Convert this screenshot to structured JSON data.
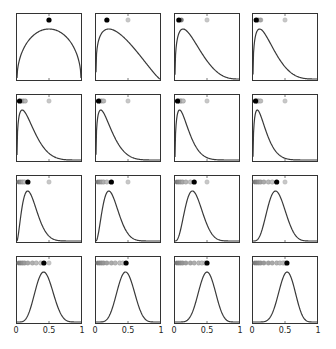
{
  "chart_data": {
    "type": "line",
    "title": "",
    "xlabel": "",
    "ylabel": "",
    "xlim": [
      0,
      1
    ],
    "x_ticks": [
      0,
      0.5,
      1
    ],
    "x_tick_labels": [
      "0",
      "0.5",
      "1"
    ],
    "grid": false,
    "legend": null,
    "colors": {
      "curve": "#3a3a3a",
      "frame": "#333333",
      "latest_dot": "#000000",
      "reference_dot": "#c8c8c8",
      "past_dot": "#9a9a9a"
    },
    "panels": [
      {
        "index": 1,
        "a": 1.5,
        "b": 1.5,
        "peak_x": 0.5,
        "latest": 0.5,
        "past": [],
        "reference": null
      },
      {
        "index": 2,
        "a": 1.3,
        "b": 2.2,
        "peak_x": 0.2,
        "latest": 0.17,
        "past": [],
        "reference": 0.5
      },
      {
        "index": 3,
        "a": 1.4,
        "b": 3.8,
        "peak_x": 0.12,
        "latest": 0.06,
        "past": [
          0.1
        ],
        "reference": 0.5
      },
      {
        "index": 4,
        "a": 1.4,
        "b": 4.5,
        "peak_x": 0.1,
        "latest": 0.05,
        "past": [
          0.08,
          0.12
        ],
        "reference": 0.5
      },
      {
        "index": 5,
        "a": 1.4,
        "b": 5.5,
        "peak_x": 0.08,
        "latest": 0.04,
        "past": [
          0.07,
          0.1,
          0.13
        ],
        "reference": 0.5
      },
      {
        "index": 6,
        "a": 1.4,
        "b": 6.0,
        "peak_x": 0.07,
        "latest": 0.04,
        "past": [
          0.06,
          0.09,
          0.12
        ],
        "reference": 0.5
      },
      {
        "index": 7,
        "a": 1.5,
        "b": 7.5,
        "peak_x": 0.07,
        "latest": 0.04,
        "past": [
          0.06,
          0.08,
          0.1,
          0.13
        ],
        "reference": 0.5
      },
      {
        "index": 8,
        "a": 1.5,
        "b": 8.0,
        "peak_x": 0.06,
        "latest": 0.04,
        "past": [
          0.05,
          0.07,
          0.09,
          0.12
        ],
        "reference": 0.5
      },
      {
        "index": 9,
        "a": 2.6,
        "b": 9.0,
        "peak_x": 0.17,
        "latest": 0.17,
        "past": [
          0.03,
          0.06,
          0.09,
          0.12
        ],
        "reference": 0.5
      },
      {
        "index": 10,
        "a": 3.0,
        "b": 9.0,
        "peak_x": 0.2,
        "latest": 0.24,
        "past": [
          0.03,
          0.06,
          0.09,
          0.12,
          0.17
        ],
        "reference": 0.5
      },
      {
        "index": 11,
        "a": 3.8,
        "b": 8.5,
        "peak_x": 0.28,
        "latest": 0.3,
        "past": [
          0.03,
          0.06,
          0.09,
          0.12,
          0.17,
          0.24
        ],
        "reference": 0.5
      },
      {
        "index": 12,
        "a": 4.8,
        "b": 8.0,
        "peak_x": 0.35,
        "latest": 0.37,
        "past": [
          0.03,
          0.06,
          0.09,
          0.12,
          0.17,
          0.24,
          0.3
        ],
        "reference": 0.5
      },
      {
        "index": 13,
        "a": 6.0,
        "b": 8.0,
        "peak_x": 0.42,
        "latest": 0.42,
        "past": [
          0.03,
          0.06,
          0.09,
          0.12,
          0.17,
          0.24,
          0.3,
          0.37
        ],
        "reference": 0.5
      },
      {
        "index": 14,
        "a": 7.0,
        "b": 8.0,
        "peak_x": 0.46,
        "latest": 0.47,
        "past": [
          0.03,
          0.06,
          0.09,
          0.12,
          0.17,
          0.24,
          0.3,
          0.37,
          0.42
        ],
        "reference": null
      },
      {
        "index": 15,
        "a": 8.0,
        "b": 8.0,
        "peak_x": 0.5,
        "latest": 0.5,
        "past": [
          0.03,
          0.06,
          0.09,
          0.12,
          0.17,
          0.24,
          0.3,
          0.37,
          0.42,
          0.47
        ],
        "reference": null
      },
      {
        "index": 16,
        "a": 9.0,
        "b": 8.0,
        "peak_x": 0.53,
        "latest": 0.53,
        "past": [
          0.03,
          0.06,
          0.09,
          0.12,
          0.17,
          0.24,
          0.3,
          0.37,
          0.42,
          0.47,
          0.5
        ],
        "reference": null
      }
    ]
  },
  "layout": {
    "col_left": [
      16,
      95,
      174,
      252
    ],
    "row_top": [
      13,
      94,
      175,
      256
    ],
    "panel_w": 66,
    "panel_h": 68
  }
}
